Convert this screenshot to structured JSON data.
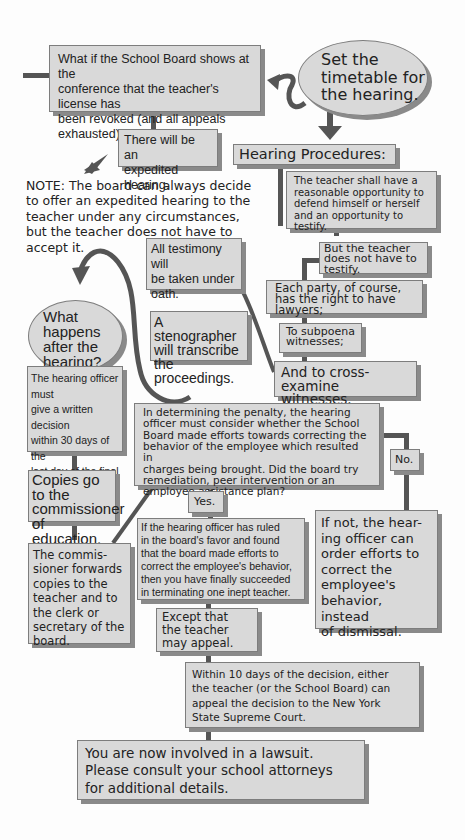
{
  "colors": {
    "box_fill": "#d9d9d9",
    "box_border": "#7d7d7d",
    "shadow": "#8a8a8a",
    "connector": "#555555",
    "background": "#fdfdfd"
  },
  "nodes": {
    "revoked_question": "What if the School Board shows at the\nconference that the teacher's license has\nbeen revoked (and all appeals exhausted)?",
    "set_timetable": "Set the\ntimetable for\nthe hearing.",
    "expedited": "There will be an\nexpedited hearing.",
    "hearing_procedures": "Hearing Procedures:",
    "note": "NOTE: The board can always decide\nto offer an expedited hearing to the\nteacher under any circumstances,\nbut the teacher does not have to\naccept it.",
    "defend": "The teacher shall have a\nreasonable opportunity to\ndefend himself or herself\nand an opportunity to\ntestify.",
    "not_testify": "But the teacher\ndoes not have to\ntestify.",
    "testimony_oath": "All testimony will\nbe taken under\noath.",
    "lawyers": "Each party, of course,\nhas the right to have\nlawyers;",
    "what_happens": "What happens\nafter the\nhearing?",
    "stenographer": "A stenographer\nwill transcribe\nthe proceedings.",
    "subpoena": "To subpoena\nwitnesses;",
    "cross_examine": "And to cross-examine\nwitnesses.",
    "written_decision": "The hearing officer must\ngive a written decision\nwithin 30 days of the\nlast day of the final\nhearing.",
    "penalty": "In determining the penalty, the hearing\nofficer must consider whether the School\nBoard made efforts towards correcting the\nbehavior of the employee which resulted in\ncharges being brought.  Did the board try\nremediation, peer intervention or an\nemployee assistance plan?",
    "no": "No.",
    "copies": "Copies go to the\ncommissioner of\neducation.",
    "yes": "Yes.",
    "ruled_favor": "If the hearing officer has ruled\nin the board's favor and found\nthat the board made efforts to\ncorrect the employee's behavior,\nthen you have finally succeeded\nin terminating one inept teacher.",
    "if_not": "If not, the hear-\ning officer can\norder efforts to\ncorrect the\nemployee's\nbehavior, instead\nof dismissal.",
    "commissioner_forwards": "The commis-\nsioner forwards\ncopies to the\nteacher and to\nthe clerk or\nsecretary of the\nboard.",
    "may_appeal": "Except that\nthe teacher\nmay appeal.",
    "within_10_days": "Within 10 days of the decision, either\nthe teacher (or the School Board) can\nappeal the decision to the New York\nState Supreme Court.",
    "lawsuit": "You are now involved in a lawsuit.\nPlease consult your school attorneys\nfor additional details."
  }
}
